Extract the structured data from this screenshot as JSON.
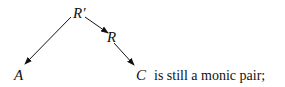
{
  "diagram": {
    "nodes": [
      {
        "id": "Rprime",
        "label": "R′"
      },
      {
        "id": "R",
        "label": "R"
      },
      {
        "id": "A",
        "label": "A"
      },
      {
        "id": "C",
        "label": "C"
      }
    ],
    "edges": [
      {
        "from": "Rprime",
        "to": "A"
      },
      {
        "from": "Rprime",
        "to": "R"
      },
      {
        "from": "R",
        "to": "C"
      }
    ]
  },
  "text": {
    "trailing": "is still a monic pair;"
  },
  "colors": {
    "ink": "#111111",
    "background": "#ffffff"
  }
}
